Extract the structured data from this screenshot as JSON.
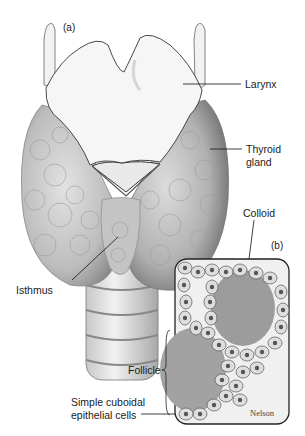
{
  "figure": {
    "panel_a_label": "(a)",
    "panel_b_label": "(b)",
    "labels": {
      "larynx": "Larynx",
      "thyroid_gland_line1": "Thyroid",
      "thyroid_gland_line2": "gland",
      "isthmus": "Isthmus",
      "colloid": "Colloid",
      "follicle": "Follicle",
      "epithelial_line1": "Simple cuboidal",
      "epithelial_line2": "epithelial cells"
    },
    "signature": "Nelson",
    "colors": {
      "background": "#ffffff",
      "tissue": "#c9c9c9",
      "tissue_shadow": "#8e8e8e",
      "larynx": "#f4f4f4",
      "colloid": "#9a9a9a",
      "cell": "#dcdcdc",
      "nucleus": "#5a5a5a",
      "line": "#111111"
    }
  }
}
